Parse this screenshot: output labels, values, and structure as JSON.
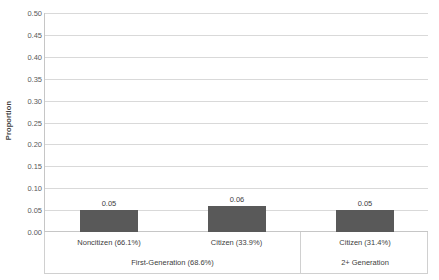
{
  "chart_data": {
    "type": "bar",
    "title": "",
    "xlabel": "",
    "ylabel": "Proportion",
    "ylim": [
      0.0,
      0.5
    ],
    "ytick_labels": [
      "0.50",
      "0.45",
      "0.40",
      "0.35",
      "0.30",
      "0.25",
      "0.20",
      "0.15",
      "0.10",
      "0.05",
      "0.00"
    ],
    "ytick_values": [
      0.5,
      0.45,
      0.4,
      0.35,
      0.3,
      0.25,
      0.2,
      0.15,
      0.1,
      0.05,
      0.0
    ],
    "grid": true,
    "legend": "none",
    "categories": [
      "Noncitizen (66.1%)",
      "Citizen (33.9%)",
      "Citizen (31.4%)"
    ],
    "values": [
      0.05,
      0.06,
      0.05
    ],
    "value_labels": [
      "0.05",
      "0.06",
      "0.05"
    ],
    "bar_color": "#595959",
    "groups": [
      {
        "label": "First-Generation (68.6%)",
        "span": 2
      },
      {
        "label": "2+ Generation",
        "span": 1
      }
    ]
  },
  "axis": {
    "y_title": "Proportion"
  },
  "colors": {
    "bar": "#595959",
    "gridline": "#d9d9d9",
    "axis_line": "#c6c6c6",
    "text": "#404040",
    "tick_text": "#595959",
    "table_border": "#d0d0d0"
  }
}
